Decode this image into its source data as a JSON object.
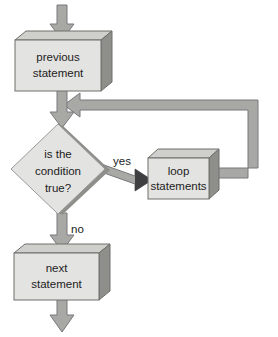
{
  "diagram": {
    "background_color": "#ffffff",
    "palette": {
      "node_face": "#e3e3e1",
      "node_top": "#cfcfcc",
      "node_side": "#8e8e8b",
      "node_outline": "#6e6e6b",
      "arrow_fill": "#a8a8a5",
      "arrow_outline": "#77777a",
      "arrow_dark": "#5f5f62",
      "text_color": "#1c1c1c"
    },
    "nodes": [
      {
        "id": "previous-statement",
        "shape": "box",
        "lines": [
          "previous",
          "statement"
        ],
        "line1": "previous",
        "line2": "statement"
      },
      {
        "id": "condition",
        "shape": "diamond",
        "lines": [
          "is the",
          "condition",
          "true?"
        ],
        "line1": "is the",
        "line2": "condition",
        "line3": "true?"
      },
      {
        "id": "loop-statements",
        "shape": "box",
        "lines": [
          "loop",
          "statements"
        ],
        "line1": "loop",
        "line2": "statements"
      },
      {
        "id": "next-statement",
        "shape": "box",
        "lines": [
          "next",
          "statement"
        ],
        "line1": "next",
        "line2": "statement"
      }
    ],
    "edges": [
      {
        "id": "entry",
        "from": "top",
        "to": "previous-statement",
        "label": ""
      },
      {
        "id": "previous-to-condition",
        "from": "previous-statement",
        "to": "condition",
        "label": ""
      },
      {
        "id": "condition-yes",
        "from": "condition",
        "to": "loop-statements",
        "label": "yes"
      },
      {
        "id": "condition-no",
        "from": "condition",
        "to": "next-statement",
        "label": "no"
      },
      {
        "id": "loop-back",
        "from": "loop-statements",
        "to": "previous-to-condition",
        "label": ""
      },
      {
        "id": "exit",
        "from": "next-statement",
        "to": "bottom",
        "label": ""
      }
    ]
  }
}
